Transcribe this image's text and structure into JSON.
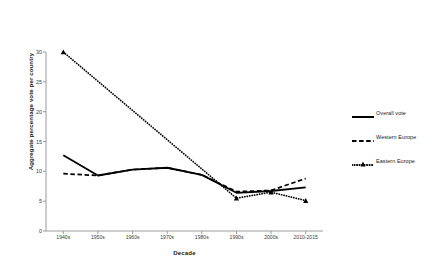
{
  "chart_data": {
    "type": "line",
    "title": "",
    "xlabel": "Decade",
    "ylabel": "Aggregate percentage vote per country",
    "categories": [
      "1940s",
      "1950s",
      "1960s",
      "1970s",
      "1980s",
      "1990s",
      "2000s",
      "2010-2015"
    ],
    "ylim": [
      0,
      30
    ],
    "yticks": [
      0,
      5,
      10,
      15,
      20,
      25,
      30
    ],
    "grid": false,
    "legend_position": "right",
    "series": [
      {
        "name": "Overall vote",
        "style": "solid",
        "marker": "none",
        "color": "#000000",
        "values": [
          12.7,
          9.3,
          10.3,
          10.6,
          9.4,
          6.4,
          6.7,
          7.3
        ]
      },
      {
        "name": "Western Europe",
        "style": "dashed",
        "marker": "none",
        "color": "#000000",
        "values": [
          9.6,
          9.3,
          10.3,
          10.6,
          9.4,
          6.6,
          6.8,
          8.8
        ]
      },
      {
        "name": "Eastern Europe",
        "style": "dotted",
        "marker": "triangle",
        "color": "#000000",
        "values": [
          30.0,
          null,
          null,
          null,
          null,
          5.5,
          6.5,
          5.1
        ]
      }
    ]
  },
  "axes": {
    "y_title": "Aggregate percentage vote per country",
    "x_title": "Decade",
    "y_tick_labels": [
      "0",
      "5",
      "10",
      "15",
      "20",
      "25",
      "30"
    ],
    "x_tick_labels": [
      "1940s",
      "1950s",
      "1960s",
      "1970s",
      "1980s",
      "1990s",
      "2000s",
      "2010-2015"
    ]
  },
  "legend": {
    "items": [
      {
        "label": "Overall vote",
        "style": "solid"
      },
      {
        "label": "Western Europe",
        "style": "dashed"
      },
      {
        "label": "Eastern Europe",
        "style": "dotted"
      }
    ]
  },
  "colors": {
    "line": "#000000",
    "axis": "#9a9a9a",
    "text": "#1a1a1a",
    "background": "#ffffff"
  }
}
